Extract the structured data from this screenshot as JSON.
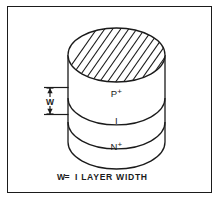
{
  "figure": {
    "title_caption": "W = I LAYER WIDTH",
    "caption_parts": {
      "symbol": "W",
      "equals": "=",
      "definition": "I LAYER WIDTH"
    },
    "frame": {
      "border_color": "#1b1b1b",
      "background_color": "#ffffff"
    },
    "device": {
      "shape": "cylinder",
      "description": "PIN diode layer stack",
      "line_color": "#1b1b1b",
      "fill_color": "#ffffff",
      "top_face": {
        "name": "hatched-top-ellipse",
        "hatch_pattern": "diagonal-lines",
        "hatch_direction": "lower-left-to-upper-right",
        "hatch_color": "#1b1b1b"
      },
      "layers": [
        {
          "id": "p-plus",
          "label": "P+",
          "label_base": "P",
          "label_sup": "+"
        },
        {
          "id": "intrinsic",
          "label": "I",
          "label_base": "I",
          "label_sup": ""
        },
        {
          "id": "n-plus",
          "label": "N+",
          "label_base": "N",
          "label_sup": "+"
        }
      ]
    },
    "dimension": {
      "name": "w-dimension",
      "label": "W",
      "arrow_style": "double-headed",
      "spans_layer": "p-plus"
    }
  }
}
